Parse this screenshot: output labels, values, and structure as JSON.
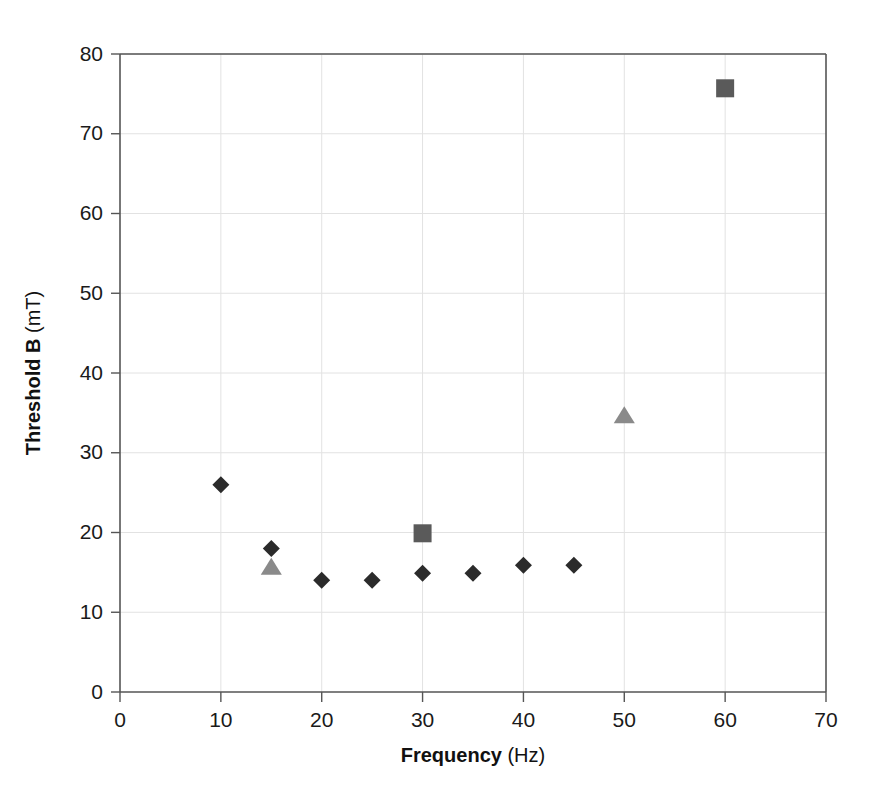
{
  "chart_data": {
    "type": "scatter",
    "title": "",
    "xlabel_bold": "Frequency",
    "xlabel_unit": " (Hz)",
    "ylabel_bold": "Threshold B",
    "ylabel_unit": " (mT)",
    "xlim": [
      0,
      70
    ],
    "ylim": [
      0,
      80
    ],
    "xticks": [
      0,
      10,
      20,
      30,
      40,
      50,
      60,
      70
    ],
    "yticks": [
      0,
      10,
      20,
      30,
      40,
      50,
      60,
      70,
      80
    ],
    "xtick_labels": [
      "0",
      "10",
      "20",
      "30",
      "40",
      "50",
      "60",
      "70"
    ],
    "ytick_labels": [
      "0",
      "10",
      "20",
      "30",
      "40",
      "50",
      "60",
      "70",
      "80"
    ],
    "grid": "both-light",
    "legend": "none",
    "series": [
      {
        "name": "diamond-series",
        "marker": "diamond",
        "color": "#2b2b2b",
        "size": 17,
        "points": [
          {
            "x": 10,
            "y": 26.0
          },
          {
            "x": 15,
            "y": 18.0
          },
          {
            "x": 20,
            "y": 14.0
          },
          {
            "x": 25,
            "y": 14.0
          },
          {
            "x": 30,
            "y": 14.9
          },
          {
            "x": 35,
            "y": 14.9
          },
          {
            "x": 40,
            "y": 15.9
          },
          {
            "x": 45,
            "y": 15.9
          }
        ]
      },
      {
        "name": "triangle-series",
        "marker": "triangle",
        "color": "#8a8a8a",
        "size": 17,
        "points": [
          {
            "x": 15,
            "y": 15.6
          },
          {
            "x": 50,
            "y": 34.6
          }
        ]
      },
      {
        "name": "square-series",
        "marker": "square",
        "color": "#5a5a5a",
        "size": 18,
        "points": [
          {
            "x": 30,
            "y": 19.9
          },
          {
            "x": 60,
            "y": 75.7
          }
        ]
      }
    ]
  },
  "colors": {
    "background": "#ffffff",
    "axis": "#555555",
    "grid": "#e2e2e2",
    "text": "#1a1a1a",
    "diamond": "#2b2b2b",
    "triangle": "#8a8a8a",
    "square": "#5a5a5a"
  }
}
